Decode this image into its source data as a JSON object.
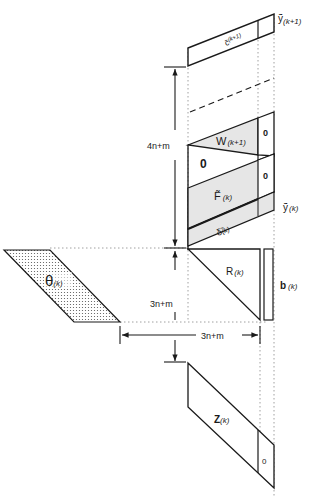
{
  "diagram": {
    "colors": {
      "stroke": "#1a1a1a",
      "shade": "#e6e6e6",
      "dots": "#555555",
      "background": "#ffffff"
    },
    "blocks": {
      "c_tilde": {
        "symbol": "c̃",
        "superscript": "(k+1)"
      },
      "y_tilde_next": {
        "symbol": "ỹ",
        "subscript": "(k+1)"
      },
      "W": {
        "symbol": "W",
        "subscript": "(k+1)",
        "right_zero": "0"
      },
      "zero_block": {
        "label": "0"
      },
      "F_tilde": {
        "symbol": "F̃",
        "subscript": "(k)",
        "right_zero": "0"
      },
      "y_tilde": {
        "symbol": "ỹ",
        "subscript": "(k)"
      },
      "delta_tilde": {
        "symbol": "δ̃",
        "subscript": "(k)"
      },
      "R": {
        "symbol": "R",
        "subscript": "(k)"
      },
      "b": {
        "symbol": "b",
        "subscript": "(k)"
      },
      "theta": {
        "symbol": "θ",
        "subscript": "(k)"
      },
      "Z": {
        "symbol": "Z",
        "subscript": "(k)",
        "right_zero": "0"
      }
    },
    "dimensions": {
      "upper_height": "4n+m",
      "lower_height": "3n+m",
      "width": "3n+m"
    }
  }
}
